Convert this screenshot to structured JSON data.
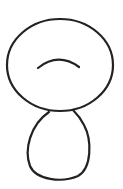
{
  "drawing": {
    "description": "hand-drawn sketch of a figure: large oval head with a curved arc mark, smaller oval body below",
    "stroke_color": "#222222",
    "background": "#ffffff",
    "shapes": [
      {
        "name": "head",
        "type": "ellipse",
        "cx": 60,
        "cy": 65,
        "rx": 53,
        "ry": 46
      },
      {
        "name": "arc-mark",
        "type": "arc",
        "from": [
          38,
          68
        ],
        "to": [
          79,
          67
        ],
        "peak_y": 59
      },
      {
        "name": "body",
        "type": "ellipse",
        "cx": 58,
        "cy": 145,
        "rx": 31,
        "ry": 34
      }
    ]
  }
}
